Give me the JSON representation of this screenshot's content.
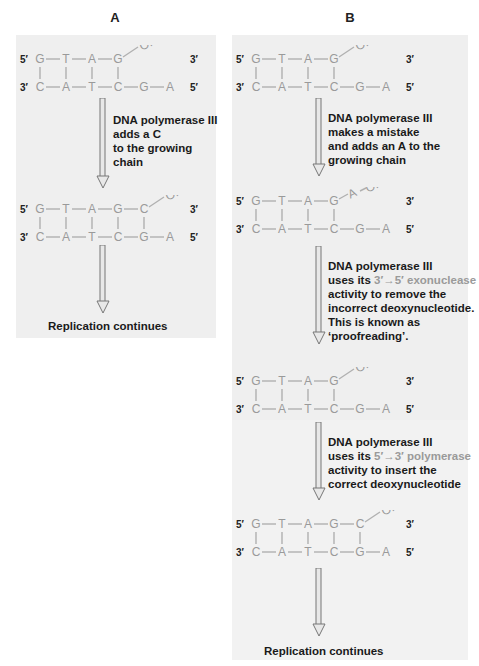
{
  "headings": {
    "a": "A",
    "b": "B"
  },
  "ends": {
    "five": "5′",
    "three": "3′"
  },
  "oh": "OH",
  "strands": {
    "template": [
      "C",
      "A",
      "T",
      "C",
      "G",
      "A"
    ],
    "primer_initial": [
      "G",
      "T",
      "A",
      "G"
    ],
    "primer_correct": [
      "G",
      "T",
      "A",
      "G",
      "C"
    ],
    "mismatch": "A"
  },
  "panel_a": {
    "step1": [
      "DNA polymerase III",
      "adds a C",
      "to the growing",
      "chain"
    ],
    "result": "Replication continues"
  },
  "panel_b": {
    "step1": [
      "DNA polymerase III",
      "makes a mistake",
      "and adds an A to the",
      "growing chain"
    ],
    "step2": {
      "l1": "DNA polymerase III",
      "l2_pre": "uses its ",
      "l2_hl": "3′→5′ exonuclease",
      "l3": "activity to remove the",
      "l4": "incorrect deoxynucleotide.",
      "l5": "This is known as",
      "l6": "‘proofreading’."
    },
    "step3": {
      "l1": "DNA polymerase III",
      "l2_pre": "uses its ",
      "l2_hl": "5′→3′ polymerase",
      "l3": "activity to insert the",
      "l4": "correct deoxynucleotide"
    },
    "result": "Replication continues"
  },
  "colors": {
    "panel": "#efefef",
    "base": "#9a9a9a",
    "text": "#1a1a1a"
  }
}
